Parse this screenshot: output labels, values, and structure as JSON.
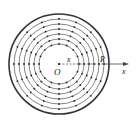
{
  "diagram": {
    "type": "concentric-rings-field",
    "center": {
      "x": 59,
      "y": 64
    },
    "outer_radius": 50,
    "inner_rings": [
      20,
      25,
      30,
      35,
      40,
      45
    ],
    "radial_directions": 16,
    "colors": {
      "stroke": "#333333",
      "dot": "#222222",
      "background": "#ffffff"
    },
    "labels": {
      "origin": "O",
      "x_inner": "x",
      "radius": "R",
      "axis": "x"
    }
  }
}
